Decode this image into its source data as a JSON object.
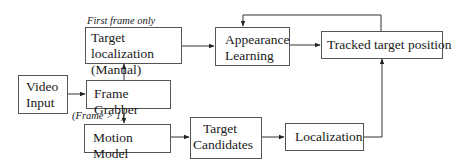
{
  "diagram": {
    "type": "flowchart",
    "nodes": {
      "video_input": {
        "line1": "Video",
        "line2": "Input"
      },
      "target_localization_manual": {
        "line1": "Target localization",
        "line2": "(Manual)"
      },
      "frame_grabber": {
        "label": "Frame Grabber"
      },
      "motion_model": {
        "label": "Motion Model"
      },
      "appearance_learning": {
        "line1": "Appearance",
        "line2": "Learning"
      },
      "tracked_target_position": {
        "label": "Tracked target position"
      },
      "target_candidates": {
        "line1": "Target",
        "line2": "Candidates"
      },
      "localization": {
        "label": "Localization"
      }
    },
    "edge_labels": {
      "first_frame_only": "First frame only",
      "frame_gt_1": "(Frame > 1)"
    },
    "edges": [
      {
        "from": "Video Input",
        "to": "Frame Grabber"
      },
      {
        "from": "Frame Grabber",
        "to": "Target localization (Manual)",
        "label": "First frame only"
      },
      {
        "from": "Frame Grabber",
        "to": "Motion Model",
        "label": "(Frame > 1)"
      },
      {
        "from": "Target localization (Manual)",
        "to": "Appearance Learning"
      },
      {
        "from": "Appearance Learning",
        "to": "Tracked target position"
      },
      {
        "from": "Tracked target position",
        "to": "Appearance Learning"
      },
      {
        "from": "Motion Model",
        "to": "Target Candidates"
      },
      {
        "from": "Target Candidates",
        "to": "Localization"
      },
      {
        "from": "Localization",
        "to": "Tracked target position"
      }
    ]
  }
}
